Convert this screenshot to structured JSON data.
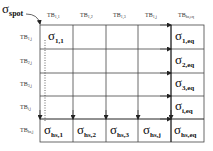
{
  "diagram": {
    "spot_label": {
      "symbol": "σ",
      "subscript": "spot"
    },
    "column_headers": [
      {
        "base": "TB",
        "sub": "1,1"
      },
      {
        "base": "TB",
        "sub": "1,2"
      },
      {
        "base": "TB",
        "sub": "1,3"
      },
      {
        "base": "TB",
        "sub": "1,j"
      },
      {
        "base": "TB",
        "sub": "hs,eq"
      }
    ],
    "row_headers": [
      {
        "base": "TB",
        "sub": "1,j"
      },
      {
        "base": "TB",
        "sub": "2,j"
      },
      {
        "base": "TB",
        "sub": "3,j"
      },
      {
        "base": "TB",
        "sub": "i,j"
      },
      {
        "base": "TB",
        "sub": "hs,j"
      }
    ],
    "first_cell": {
      "symbol": "σ",
      "subscript": "1,1"
    },
    "right_column": [
      {
        "symbol": "σ",
        "subscript": "1,eq"
      },
      {
        "symbol": "σ",
        "subscript": "2,eq"
      },
      {
        "symbol": "σ",
        "subscript": "3,eq"
      },
      {
        "symbol": "σ",
        "subscript": "i,eq"
      }
    ],
    "bottom_row": [
      {
        "symbol": "σ",
        "subscript": "hs,1"
      },
      {
        "symbol": "σ",
        "subscript": "hs,2"
      },
      {
        "symbol": "σ",
        "subscript": "hs,3"
      },
      {
        "symbol": "σ",
        "subscript": "hs,j"
      },
      {
        "symbol": "σ",
        "subscript": "hs,eq"
      }
    ]
  }
}
